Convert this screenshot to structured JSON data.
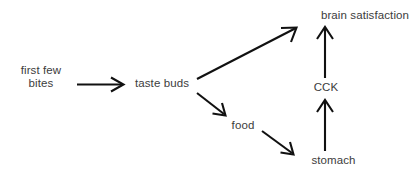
{
  "diagram": {
    "background_color": "#ffffff",
    "text_color": "#3c3c3c",
    "arrow_color": "#111111",
    "nodes": [
      {
        "id": "first-few-bites",
        "label": "first few bites",
        "line1": "first few",
        "line2": "bites"
      },
      {
        "id": "taste-buds",
        "label": "taste buds"
      },
      {
        "id": "food",
        "label": "food"
      },
      {
        "id": "brain-satisfaction",
        "label": "brain satisfaction"
      },
      {
        "id": "cck",
        "label": "CCK"
      },
      {
        "id": "stomach",
        "label": "stomach"
      }
    ],
    "edges": [
      {
        "id": "edge-bites-to-taste-buds",
        "from": "first few bites",
        "to": "taste buds",
        "direction": "right"
      },
      {
        "id": "edge-taste-buds-to-brain",
        "from": "taste buds",
        "to": "brain satisfaction",
        "direction": "up-right"
      },
      {
        "id": "edge-taste-buds-to-food",
        "from": "taste buds",
        "to": "food",
        "direction": "down-right"
      },
      {
        "id": "edge-food-to-stomach",
        "from": "food",
        "to": "stomach",
        "direction": "down-right"
      },
      {
        "id": "edge-stomach-to-cck",
        "from": "stomach",
        "to": "CCK",
        "direction": "up"
      },
      {
        "id": "edge-cck-to-brain",
        "from": "CCK",
        "to": "brain satisfaction",
        "direction": "up"
      }
    ]
  }
}
